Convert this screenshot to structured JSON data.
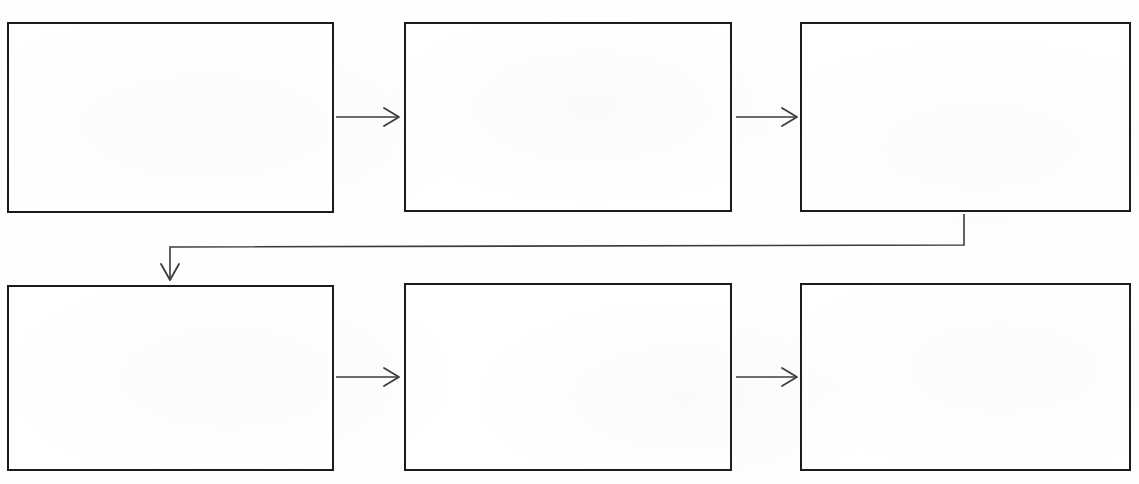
{
  "document": {
    "kind": "scanned-flowchart",
    "page_background": "#fefefe",
    "ink_color": "#1b1b1b",
    "connector_color": "#3a3a3f"
  },
  "title": {
    "text": "",
    "clipped_at_top_edge": true,
    "x": 0,
    "y": -9,
    "font_size_px": 17
  },
  "nodes": [
    {
      "id": "box-1",
      "label": "",
      "x": 7,
      "y": 22,
      "w": 327,
      "h": 191
    },
    {
      "id": "box-2",
      "label": "",
      "x": 404,
      "y": 22,
      "w": 328,
      "h": 190
    },
    {
      "id": "box-3",
      "label": "",
      "x": 800,
      "y": 22,
      "w": 331,
      "h": 190
    },
    {
      "id": "box-4",
      "label": "",
      "x": 7,
      "y": 285,
      "w": 327,
      "h": 186
    },
    {
      "id": "box-5",
      "label": "",
      "x": 404,
      "y": 283,
      "w": 328,
      "h": 188
    },
    {
      "id": "box-6",
      "label": "",
      "x": 800,
      "y": 283,
      "w": 331,
      "h": 188
    }
  ],
  "edges": [
    {
      "id": "edge-1-2",
      "from": "box-1",
      "to": "box-2",
      "label": "",
      "kind": "straight-right",
      "path": "M 336 117 L 398 117",
      "arrowhead": "M 384 108 L 399 117 L 384 126"
    },
    {
      "id": "edge-2-3",
      "from": "box-2",
      "to": "box-3",
      "label": "",
      "kind": "straight-right",
      "path": "M 736 117 L 796 117",
      "arrowhead": "M 782 108 L 797 117 L 782 126"
    },
    {
      "id": "edge-3-4",
      "from": "box-3",
      "to": "box-4",
      "label": "",
      "kind": "wrap-down-left",
      "path": "M 964 214 L 964 245 L 170 247 L 170 278",
      "arrowhead": "M 161 264 L 170 280 L 179 264"
    },
    {
      "id": "edge-4-5",
      "from": "box-4",
      "to": "box-5",
      "label": "",
      "kind": "straight-right",
      "path": "M 336 377 L 398 377",
      "arrowhead": "M 384 368 L 399 377 L 384 386"
    },
    {
      "id": "edge-5-6",
      "from": "box-5",
      "to": "box-6",
      "label": "",
      "kind": "straight-right",
      "path": "M 736 377 L 796 377",
      "arrowhead": "M 782 368 L 797 377 L 782 386"
    }
  ]
}
